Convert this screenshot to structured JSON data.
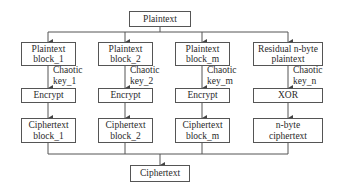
{
  "top": {
    "label": "Plaintext"
  },
  "bottom": {
    "label": "Ciphertext"
  },
  "columns": [
    {
      "input": [
        "Plaintext",
        "block_1"
      ],
      "key": [
        "Chaotic",
        "key_1"
      ],
      "op": "Encrypt",
      "output": [
        "Ciphertext",
        "block_1"
      ]
    },
    {
      "input": [
        "Plaintext",
        "block_2"
      ],
      "key": [
        "Chaotic",
        "key_2"
      ],
      "op": "Encrypt",
      "output": [
        "Ciphertext",
        "block_2"
      ]
    },
    {
      "input": [
        "Plaintext",
        "block_m"
      ],
      "key": [
        "Chaotic",
        "key_m"
      ],
      "op": "Encrypt",
      "output": [
        "Ciphertext",
        "block_m"
      ]
    },
    {
      "input": [
        "Residual n-byte",
        "plaintext"
      ],
      "key": [
        "Chaotic",
        "key_n"
      ],
      "op": "XOR",
      "output": [
        "n-byte",
        "ciphertext"
      ]
    }
  ],
  "colors": {
    "line": "#555555",
    "text": "#2a2a2a",
    "background": "#ffffff"
  }
}
